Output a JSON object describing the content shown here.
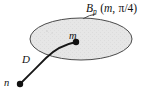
{
  "figure": {
    "type": "geometry-diagram",
    "background_color": "#ffffff",
    "width": 154,
    "height": 94
  },
  "labels": {
    "ball": {
      "base": "B",
      "subscript": "p",
      "open_paren": "(",
      "center_point": "m",
      "comma": ",",
      "radius_numerator": "π",
      "radius_slash": "/",
      "radius_denominator": "4",
      "close_paren": ")",
      "full_text": "Bₚ (m, π/4)"
    },
    "center_point": "m",
    "curve": "D",
    "exterior_point": "n"
  },
  "shapes": {
    "ellipse": {
      "name": "ball-region",
      "cx": 81,
      "cy": 39,
      "rx": 51,
      "ry": 21,
      "fill_color": "#e3e3e3",
      "stroke_color": "#4a4a4a",
      "stroke_width": 1
    },
    "curve": {
      "name": "path-D",
      "stroke_color": "#171717",
      "stroke_width": 1.7,
      "from": [
        20,
        84
      ],
      "to": [
        76,
        42
      ]
    },
    "point_m": {
      "cx": 76,
      "cy": 42,
      "r": 3.1,
      "color": "#111111"
    },
    "point_n": {
      "cx": 20,
      "cy": 84,
      "r": 3.1,
      "color": "#111111"
    },
    "leader_line": {
      "name": "label-leader",
      "from": [
        84,
        18
      ],
      "to": [
        95,
        14
      ],
      "stroke_color": "#4a4a4a"
    }
  },
  "colors": {
    "ink": "#111111",
    "stroke": "#4a4a4a",
    "shade": "#e3e3e3",
    "page": "#ffffff"
  }
}
